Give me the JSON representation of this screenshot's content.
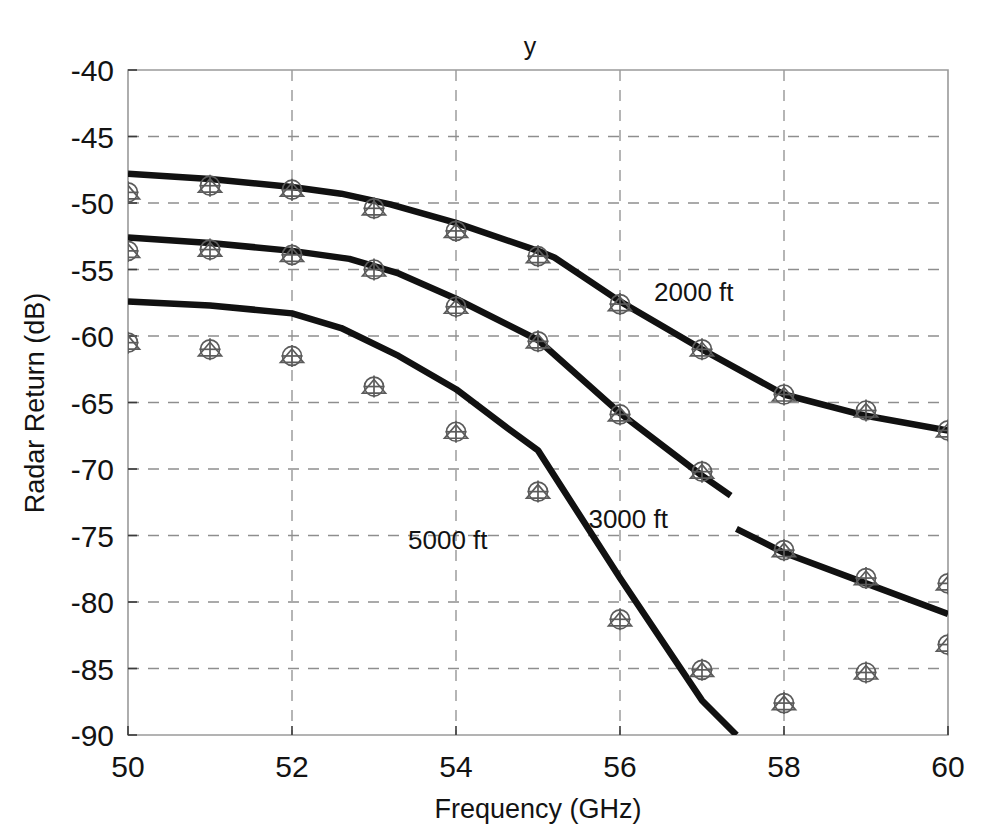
{
  "chart_data": {
    "type": "line",
    "title": "y",
    "xlabel": "Frequency (GHz)",
    "ylabel": "Radar Return (dB)",
    "xlim": [
      50,
      60
    ],
    "ylim": [
      -90,
      -40
    ],
    "xticks": [
      50,
      52,
      54,
      56,
      58,
      60
    ],
    "yticks": [
      -40,
      -45,
      -50,
      -55,
      -60,
      -65,
      -70,
      -75,
      -80,
      -85,
      -90
    ],
    "xtick_labels": [
      "50",
      "52",
      "54",
      "56",
      "58",
      "60"
    ],
    "ytick_labels": [
      "-40",
      "-45",
      "-50",
      "-55",
      "-60",
      "-65",
      "-70",
      "-75",
      "-80",
      "-85",
      "-90"
    ],
    "grid": true,
    "legend_position": "inline-annotations",
    "annotations": [
      {
        "text": "2000 ft",
        "x": 56.9,
        "y": -57.4
      },
      {
        "text": "3000 ft",
        "x": 56.1,
        "y": -74.4
      },
      {
        "text": "5000 ft",
        "x": 53.9,
        "y": -76.0
      },
      {
        "text": "y",
        "x": 55.0,
        "y": -38.0
      }
    ],
    "series": [
      {
        "name": "2000 ft",
        "label": "2000 ft",
        "kind": "model-curve",
        "marker": "none",
        "x": [
          50.0,
          51.0,
          52.0,
          52.6,
          53.2,
          54.0,
          55.0,
          55.2,
          56.0,
          57.0,
          58.0,
          59.0,
          60.0
        ],
        "y": [
          -47.8,
          -48.2,
          -48.8,
          -49.3,
          -50.1,
          -51.5,
          -53.6,
          -54.1,
          -57.4,
          -61.0,
          -64.4,
          -66.0,
          -67.1
        ]
      },
      {
        "name": "3000 ft",
        "label": "3000 ft",
        "kind": "model-curve",
        "marker": "none",
        "x": [
          50.0,
          51.0,
          52.0,
          52.7,
          53.3,
          54.0,
          55.0,
          56.0,
          57.0,
          57.35
        ],
        "y": [
          -52.6,
          -53.0,
          -53.6,
          -54.2,
          -55.3,
          -57.2,
          -60.3,
          -65.8,
          -70.5,
          -72.0
        ]
      },
      {
        "name": "5000 ft",
        "label": "5000 ft",
        "kind": "model-curve",
        "marker": "none",
        "x": [
          50.0,
          51.0,
          52.0,
          52.6,
          53.3,
          54.0,
          54.6,
          55.0,
          56.0,
          57.0,
          57.42
        ],
        "y": [
          -57.4,
          -57.7,
          -58.3,
          -59.4,
          -61.5,
          -64.0,
          -66.8,
          -68.6,
          -78.2,
          -87.4,
          -90.0
        ]
      },
      {
        "name": "5000 ft tail",
        "label": "5000 ft",
        "kind": "model-curve",
        "marker": "none",
        "x": [
          57.42,
          58.0,
          59.0,
          60.0
        ],
        "y": [
          -74.5,
          -76.3,
          -78.6,
          -80.9
        ]
      },
      {
        "name": "2000 ft measured",
        "label": "2000 ft",
        "kind": "measured-points",
        "marker": "circle+triangle+plus",
        "x": [
          50,
          51,
          52,
          53,
          54,
          55,
          56,
          57,
          58,
          59,
          60
        ],
        "y": [
          -49.2,
          -48.7,
          -49.0,
          -50.4,
          -52.1,
          -54.0,
          -57.6,
          -61.0,
          -64.4,
          -65.6,
          -67.1
        ]
      },
      {
        "name": "3000 ft measured",
        "label": "3000 ft",
        "kind": "measured-points",
        "marker": "circle+triangle+plus",
        "x": [
          50,
          51,
          52,
          53,
          54,
          55,
          56,
          57,
          58,
          59,
          60
        ],
        "y": [
          -53.6,
          -53.5,
          -53.9,
          -55.0,
          -57.8,
          -60.4,
          -65.9,
          -70.2,
          -76.1,
          -78.2,
          -78.6
        ]
      },
      {
        "name": "5000 ft measured",
        "label": "5000 ft",
        "kind": "measured-points",
        "marker": "circle+triangle+plus",
        "x": [
          50,
          51,
          52,
          53,
          54,
          55,
          56,
          57,
          58,
          59,
          60
        ],
        "y": [
          -60.5,
          -61.0,
          -61.5,
          -63.8,
          -67.2,
          -71.7,
          -81.3,
          -85.1,
          -87.6,
          -85.3,
          -83.2
        ]
      }
    ],
    "marker_legend_note": "each measured point drawn as overlapping circle, triangle and plus",
    "colors": {
      "curve": "#111111",
      "marker": "#5b5b5b",
      "grid": "#8e8e8e",
      "frame": "#9a9a9a",
      "text": "#131313",
      "background": "#ffffff"
    }
  }
}
